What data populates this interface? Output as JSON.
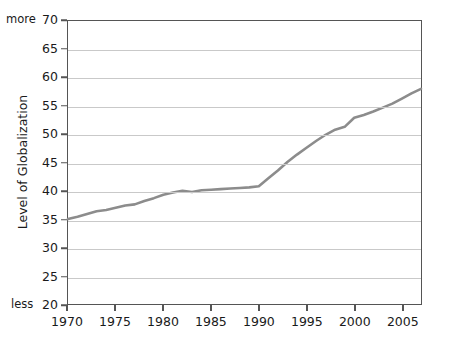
{
  "chart_data": {
    "type": "line",
    "title": "",
    "xlabel": "",
    "ylabel": "Level of Globalization",
    "xlim": [
      1970,
      2007
    ],
    "ylim": [
      20,
      70
    ],
    "grid": true,
    "legend": "none",
    "line_color": "#8c8c8c",
    "axis_color": "#555555",
    "grid_color": "#c9c9c9",
    "y_ticks": [
      20,
      25,
      30,
      35,
      40,
      45,
      50,
      55,
      60,
      65,
      70
    ],
    "y_tick_labels": [
      "20",
      "25",
      "30",
      "35",
      "40",
      "45",
      "50",
      "55",
      "60",
      "65",
      "70"
    ],
    "y_axis_low_label": "less",
    "y_axis_high_label": "more",
    "x_ticks": [
      1970,
      1975,
      1980,
      1985,
      1990,
      1995,
      2000,
      2005
    ],
    "x_tick_labels": [
      "1970",
      "1975",
      "1980",
      "1985",
      "1990",
      "1995",
      "2000",
      "2005"
    ],
    "series": [
      {
        "name": "Level of Globalization",
        "x": [
          1970,
          1971,
          1972,
          1973,
          1974,
          1975,
          1976,
          1977,
          1978,
          1979,
          1980,
          1981,
          1982,
          1983,
          1984,
          1985,
          1986,
          1987,
          1988,
          1989,
          1990,
          1991,
          1992,
          1993,
          1994,
          1995,
          1996,
          1997,
          1998,
          1999,
          2000,
          2001,
          2002,
          2003,
          2004,
          2005,
          2006,
          2007
        ],
        "values": [
          35.0,
          35.4,
          35.9,
          36.4,
          36.6,
          37.0,
          37.4,
          37.6,
          38.2,
          38.7,
          39.3,
          39.7,
          40.0,
          39.8,
          40.1,
          40.2,
          40.3,
          40.4,
          40.5,
          40.6,
          40.8,
          42.2,
          43.6,
          45.1,
          46.4,
          47.6,
          48.8,
          49.9,
          50.8,
          51.3,
          52.9,
          53.4,
          54.0,
          54.7,
          55.4,
          56.3,
          57.2,
          58.0
        ]
      }
    ]
  }
}
